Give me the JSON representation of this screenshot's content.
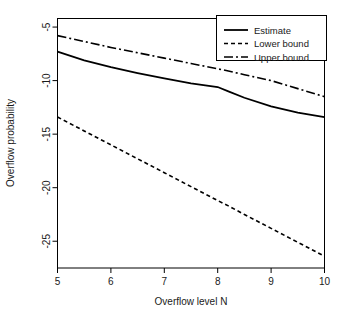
{
  "chart_data": {
    "type": "line",
    "title": "",
    "xlabel": "Overflow level N",
    "ylabel": "Overflow probability",
    "xlim": [
      5,
      10
    ],
    "ylim": [
      -27.5,
      -4.2
    ],
    "xticks": [
      5,
      6,
      7,
      8,
      9,
      10
    ],
    "xticklabels": [
      "5",
      "6",
      "7",
      "8",
      "9",
      "10"
    ],
    "yticks": [
      -5,
      -10,
      -15,
      -20,
      -25
    ],
    "yticklabels": [
      "-5",
      "-10",
      "-15",
      "-20",
      "-25"
    ],
    "grid": false,
    "legend_position": "top-right",
    "x": [
      5,
      5.5,
      6,
      6.5,
      7,
      7.5,
      8,
      8.2,
      8.5,
      9,
      9.5,
      10
    ],
    "series": [
      {
        "name": "Estimate",
        "style": "solid",
        "values": [
          -7.3,
          -8.1,
          -8.75,
          -9.3,
          -9.8,
          -10.25,
          -10.6,
          -11.0,
          -11.6,
          -12.4,
          -13.0,
          -13.4
        ]
      },
      {
        "name": "Lower bound",
        "style": "dotted",
        "values": [
          -13.4,
          -14.7,
          -16.0,
          -17.3,
          -18.6,
          -19.9,
          -21.2,
          -21.7,
          -22.5,
          -23.8,
          -25.1,
          -26.4
        ]
      },
      {
        "name": "Upper bound",
        "style": "dashdot",
        "values": [
          -5.8,
          -6.35,
          -6.9,
          -7.4,
          -7.9,
          -8.4,
          -8.9,
          -9.1,
          -9.45,
          -10.0,
          -10.75,
          -11.5
        ]
      }
    ]
  },
  "legend": {
    "entries": [
      {
        "label": "Estimate",
        "style": "solid"
      },
      {
        "label": "Lower bound",
        "style": "dotted"
      },
      {
        "label": "Upper bound",
        "style": "dashdot"
      }
    ]
  },
  "colors": {
    "line": "#000000",
    "axis": "#000000",
    "background": "#ffffff",
    "text": "#1a1a1a"
  }
}
